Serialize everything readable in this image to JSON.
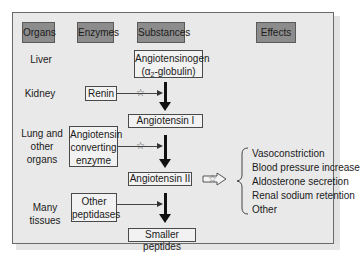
{
  "headers": {
    "organs": "Organs",
    "enzymes": "Enzymes",
    "substances": "Substances",
    "effects": "Effects"
  },
  "organs": {
    "liver": "Liver",
    "kidney": "Kidney",
    "lung_line1": "Lung and",
    "lung_line2": "other",
    "lung_line3": "organs",
    "many_tissues": "Many tissues"
  },
  "enzymes": {
    "renin": "Renin",
    "ace_line1": "Angiotensin",
    "ace_line2": "converting",
    "ace_line3": "enzyme",
    "other_line1": "Other",
    "other_line2": "peptidases"
  },
  "substances": {
    "angiotensinogen_line1": "Angiotensinogen",
    "angiotensinogen_line2_pre": "(α",
    "angiotensinogen_line2_sub": "2",
    "angiotensinogen_line2_post": "-globulin)",
    "angiotensin1": "Angiotensin I",
    "angiotensin2": "Angiotensin II",
    "smaller_peptides": "Smaller peptides"
  },
  "effects": [
    "Vasoconstriction",
    "Blood pressure increase",
    "Aldosterone secretion",
    "Renal sodium retention",
    "Other"
  ],
  "symbols": {
    "star": "☆"
  },
  "colors": {
    "header_bg": "#8c8c8c",
    "panel_bg": "#e9e9e9",
    "box_bg": "#f2f2f2"
  }
}
